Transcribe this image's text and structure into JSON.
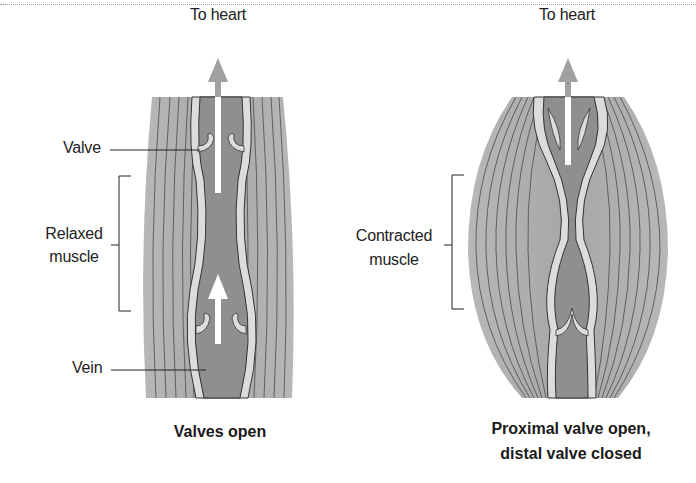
{
  "figure": {
    "left_panel": {
      "arrow_label": "To heart",
      "valve_label": "Valve",
      "muscle_label_line1": "Relaxed",
      "muscle_label_line2": "muscle",
      "vein_label": "Vein",
      "caption": "Valves open"
    },
    "right_panel": {
      "arrow_label": "To heart",
      "muscle_label_line1": "Contracted",
      "muscle_label_line2": "muscle",
      "caption_line1": "Proximal valve open,",
      "caption_line2": "distal valve closed"
    },
    "colors": {
      "muscle": "#a9a9a9",
      "muscle_lines": "#4a4a4a",
      "vein_wall": "#dcdcdc",
      "vein_lumen": "#8f8f8f",
      "arrow_gray": "#a0a0a0",
      "arrow_white": "#ffffff"
    }
  }
}
